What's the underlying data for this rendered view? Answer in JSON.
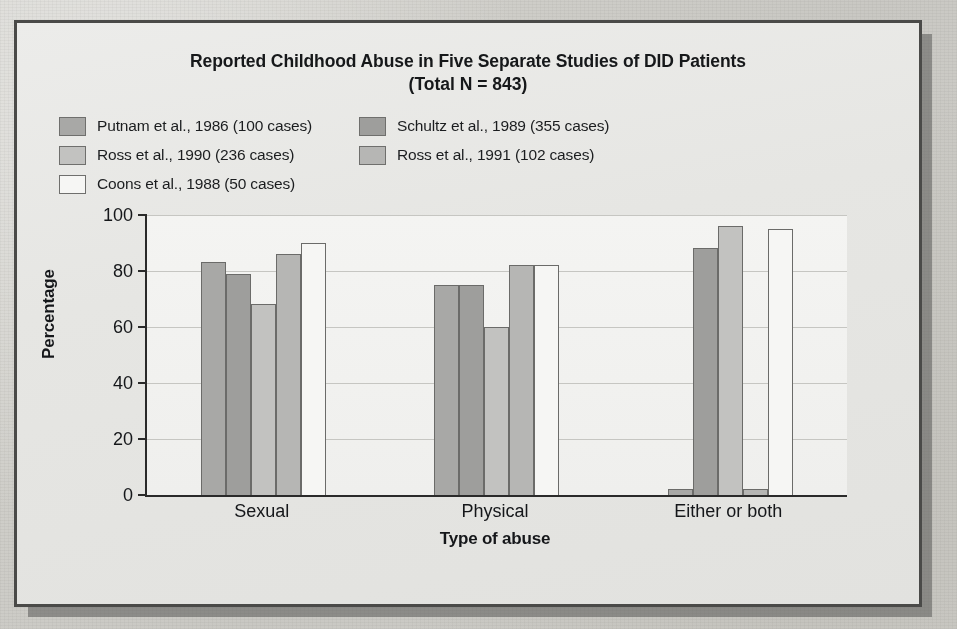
{
  "figure": {
    "title": "Reported Childhood Abuse in Five Separate Studies of DID Patients",
    "subtitle": "(Total N = 843)"
  },
  "legend": {
    "items": [
      {
        "label": "Putnam et al., 1986 (100 cases)",
        "color": "#a8a8a6"
      },
      {
        "label": "Schultz et al., 1989 (355 cases)",
        "color": "#9e9e9c"
      },
      {
        "label": "Ross et al., 1990 (236 cases)",
        "color": "#c2c2c0"
      },
      {
        "label": "Ross et al., 1991 (102 cases)",
        "color": "#b6b6b4"
      },
      {
        "label": "Coons et al., 1988 (50 cases)",
        "color": "#f6f6f4"
      }
    ]
  },
  "axes": {
    "y_title": "Percentage",
    "x_title": "Type of abuse",
    "y_ticks": [
      "100",
      "80",
      "60",
      "40",
      "20",
      "0"
    ]
  },
  "chart_data": {
    "type": "bar",
    "title": "Reported Childhood Abuse in Five Separate Studies of DID Patients (Total N = 843)",
    "xlabel": "Type of abuse",
    "ylabel": "Percentage",
    "ylim": [
      0,
      100
    ],
    "yticks": [
      0,
      20,
      40,
      60,
      80,
      100
    ],
    "grid": true,
    "legend_position": "top-left",
    "categories": [
      "Sexual",
      "Physical",
      "Either or both"
    ],
    "series": [
      {
        "name": "Putnam et al., 1986 (100 cases)",
        "color": "#a8a8a6",
        "values": [
          83,
          75,
          2
        ]
      },
      {
        "name": "Schultz et al., 1989 (355 cases)",
        "color": "#9e9e9c",
        "values": [
          79,
          75,
          88
        ]
      },
      {
        "name": "Ross et al., 1990 (236 cases)",
        "color": "#c2c2c0",
        "values": [
          68,
          60,
          96
        ]
      },
      {
        "name": "Ross et al., 1991 (102 cases)",
        "color": "#b6b6b4",
        "values": [
          86,
          82,
          2
        ]
      },
      {
        "name": "Coons et al., 1988 (50 cases)",
        "color": "#f6f6f4",
        "values": [
          90,
          82,
          95
        ]
      }
    ]
  }
}
